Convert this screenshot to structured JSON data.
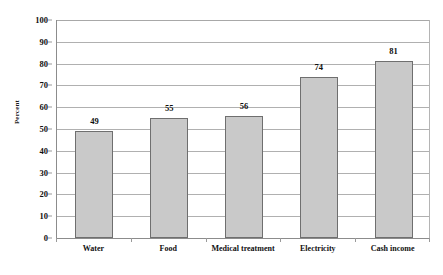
{
  "chart_data": {
    "type": "bar",
    "title": "",
    "xlabel": "",
    "ylabel": "Percent",
    "categories": [
      "Water",
      "Food",
      "Medical treatment",
      "Electricity",
      "Cash income"
    ],
    "values": [
      49,
      55,
      56,
      74,
      81
    ],
    "value_labels": [
      "49",
      "55",
      "56",
      "74",
      "81"
    ],
    "ylim": [
      0,
      100
    ],
    "ytick_labels": [
      "100",
      "90",
      "80",
      "70",
      "60",
      "50",
      "40",
      "30",
      "20",
      "10",
      "0"
    ],
    "ytick_values": [
      100,
      90,
      80,
      70,
      60,
      50,
      40,
      30,
      20,
      10,
      0
    ],
    "grid": true,
    "legend": "none",
    "series": [
      {
        "name": "Percent",
        "values": [
          49,
          55,
          56,
          74,
          81
        ]
      }
    ],
    "colors": {
      "bar_fill": "#c9c9c9",
      "bar_border": "#6f6f6f",
      "gridline": "#b0b0b0",
      "axis": "#8c8c8c",
      "text": "#0f0f0f",
      "background": "#ffffff"
    }
  }
}
